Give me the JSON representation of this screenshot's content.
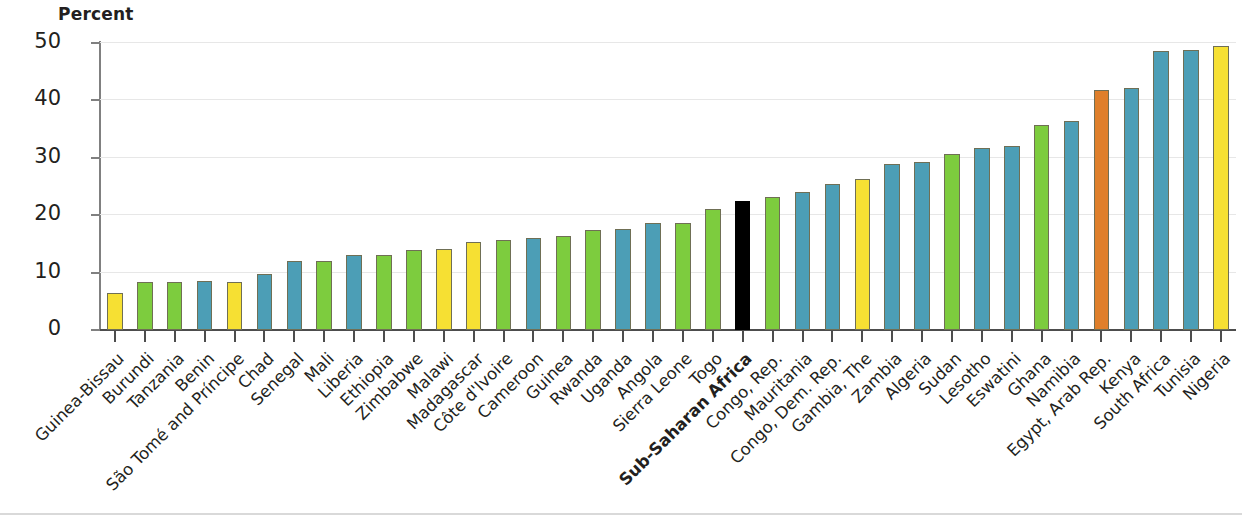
{
  "chart_data": {
    "type": "bar",
    "title": "",
    "ylabel": "Percent",
    "xlabel": "",
    "ylim": [
      0,
      50
    ],
    "yticks": [
      0,
      10,
      20,
      30,
      40,
      50
    ],
    "grid": true,
    "legend": "none",
    "categories": [
      "Guinea-Bissau",
      "Burundi",
      "Tanzania",
      "Benin",
      "São Tomé and Príncipe",
      "Chad",
      "Senegal",
      "Mali",
      "Liberia",
      "Ethiopia",
      "Zimbabwe",
      "Malawi",
      "Madagascar",
      "Côte d'Ivoire",
      "Cameroon",
      "Guinea",
      "Rwanda",
      "Uganda",
      "Angola",
      "Sierra Leone",
      "Togo",
      "Sub-Saharan Africa",
      "Congo, Rep.",
      "Mauritania",
      "Congo, Dem. Rep.",
      "Gambia, The",
      "Zambia",
      "Algeria",
      "Sudan",
      "Lesotho",
      "Eswatini",
      "Ghana",
      "Namibia",
      "Egypt, Arab Rep.",
      "Kenya",
      "South Africa",
      "Tunisia",
      "Nigeria"
    ],
    "values": [
      6.5,
      8.3,
      8.3,
      8.5,
      8.4,
      9.8,
      12.0,
      12.1,
      13.0,
      13.1,
      14.0,
      14.1,
      15.3,
      15.6,
      16.0,
      16.4,
      17.4,
      17.6,
      18.7,
      18.7,
      21.0,
      22.4,
      23.2,
      24.1,
      25.5,
      26.3,
      28.9,
      29.2,
      30.6,
      31.7,
      32.1,
      35.7,
      36.4,
      41.8,
      42.2,
      48.6,
      48.8,
      49.4
    ],
    "colors": [
      "yellow",
      "green",
      "green",
      "blue",
      "yellow",
      "blue",
      "blue",
      "green",
      "blue",
      "green",
      "green",
      "yellow",
      "yellow",
      "green",
      "blue",
      "green",
      "green",
      "blue",
      "blue",
      "green",
      "green",
      "black",
      "green",
      "blue",
      "blue",
      "yellow",
      "blue",
      "blue",
      "green",
      "blue",
      "blue",
      "green",
      "blue",
      "orange",
      "blue",
      "blue",
      "blue",
      "yellow"
    ],
    "highlight_category": "Sub-Saharan Africa",
    "palette": {
      "yellow": "#F6E033",
      "green": "#7DCC3E",
      "blue": "#4C9EB6",
      "orange": "#DF7F2B",
      "black": "#000000",
      "gridline": "#E7E7E7",
      "axis": "#4D4D4D",
      "text": "#231F20"
    }
  }
}
